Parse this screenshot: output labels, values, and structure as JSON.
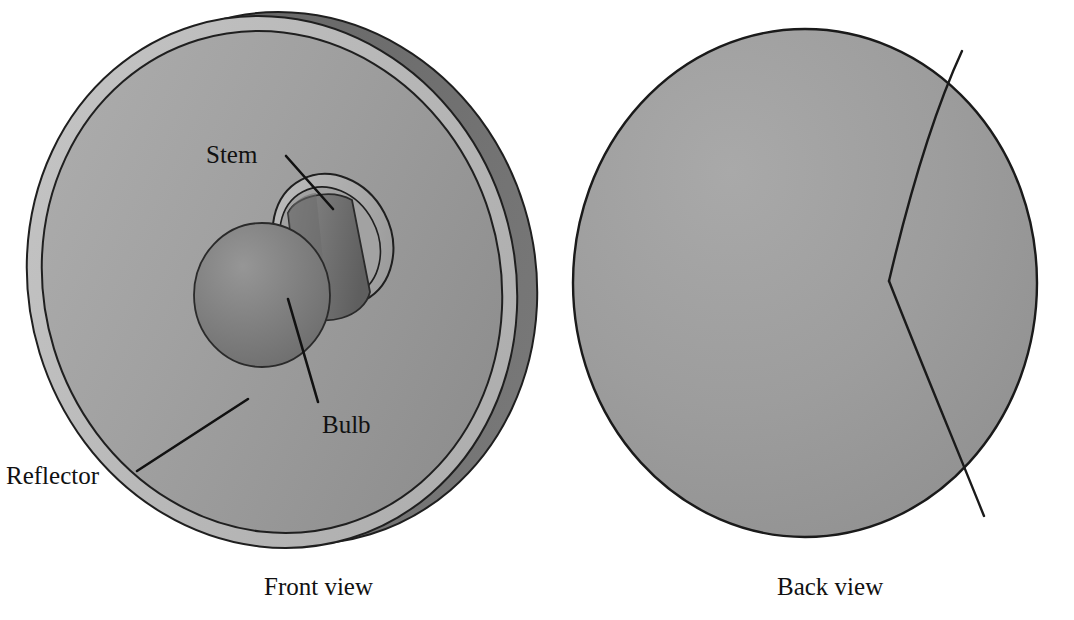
{
  "figure": {
    "background_color": "#ffffff",
    "line_color": "#111111"
  },
  "views": [
    {
      "id": "front-view",
      "caption": "Front view",
      "caption_position": {
        "x": 264,
        "y": 574
      },
      "description": "Parabolic reflector dish seen from the front, tilted, showing the bulb and stem mounted at the focus",
      "parts": [
        {
          "name": "Reflector",
          "label": "Reflector",
          "label_position": {
            "x": 6,
            "y": 463
          },
          "leader_from": {
            "x": 136,
            "y": 470
          },
          "leader_to": {
            "x": 247,
            "y": 400
          },
          "fill_color": "#9b9b9b",
          "rim_color": "#b4b4b4",
          "shell_color": "#6f6f6f"
        },
        {
          "name": "Bulb",
          "label": "Bulb",
          "label_position": {
            "x": 322,
            "y": 412
          },
          "leader_from": {
            "x": 318,
            "y": 400
          },
          "leader_to": {
            "x": 288,
            "y": 300
          },
          "fill_color": "#7e7e7e"
        },
        {
          "name": "Stem",
          "label": "Stem",
          "label_position": {
            "x": 206,
            "y": 142
          },
          "leader_from": {
            "x": 286,
            "y": 156
          },
          "leader_to": {
            "x": 333,
            "y": 209
          },
          "fill_color": "#6f6f6f"
        }
      ]
    },
    {
      "id": "back-view",
      "caption": "Back view",
      "caption_position": {
        "x": 777,
        "y": 574
      },
      "description": "Same reflector seen from behind as a smooth shell with a curved seam on the right side",
      "parts": [
        {
          "name": "Reflector shell",
          "fill_color": "#9b9b9b",
          "outline_color": "#1a1a1a",
          "seam": "curved V-shaped parting line on the right side"
        }
      ]
    }
  ],
  "colors": {
    "dish_light": "#a8a8a8",
    "dish_mid": "#9a9a9a",
    "dish_dark": "#8a8a8a",
    "rim_highlight": "#bdbdbd",
    "back_shell": "#6e6e6e",
    "bulb_light": "#8d8d8d",
    "bulb_dark": "#6b6b6b",
    "stem_light": "#8a8a8a",
    "stem_dark": "#636363",
    "outline": "#1a1a1a",
    "background": "#ffffff"
  }
}
